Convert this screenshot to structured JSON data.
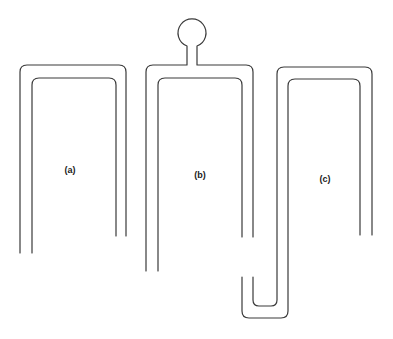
{
  "figure": {
    "stroke_color": "#3a3a3a",
    "background": "#ffffff"
  },
  "panels": [
    {
      "id": "a",
      "label": "(a)",
      "feature": "plain hairpin"
    },
    {
      "id": "b",
      "label": "(b)",
      "feature": "hairpin with circular stub on top"
    },
    {
      "id": "c",
      "label": "(c)",
      "feature": "hairpin with extended J-shaped folded leg"
    }
  ]
}
